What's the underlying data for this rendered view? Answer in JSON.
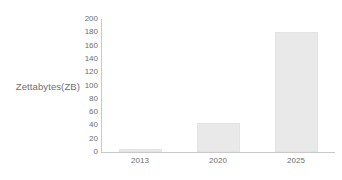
{
  "chart_data": {
    "type": "bar",
    "title": "",
    "subtitle": "",
    "xlabel": "",
    "ylabel": "Zettabytes(ZB)",
    "categories": [
      "2013",
      "2020",
      "2025"
    ],
    "values": [
      4,
      44,
      180
    ],
    "series": [
      {
        "name": "Zettabytes(ZB)",
        "values": [
          4,
          44,
          180
        ]
      }
    ],
    "ylim": [
      0,
      200
    ],
    "y_ticks": [
      0,
      20,
      40,
      60,
      80,
      100,
      120,
      140,
      160,
      180,
      200
    ],
    "y_tick_labels": [
      "0",
      "20",
      "40",
      "60",
      "80",
      "100",
      "120",
      "140",
      "160",
      "180",
      "200"
    ],
    "x_tick_labels": [
      "2013",
      "2020",
      "2025"
    ],
    "grid": false,
    "legend": false,
    "legend_position": "none",
    "annotations": [],
    "colors": {
      "bar_fill": "#e9e9e9",
      "bar_border": "#e3e3e3",
      "axis_line": "#c9c9c9",
      "tick_text": "#6e6e6e",
      "background": "#ffffff"
    }
  }
}
